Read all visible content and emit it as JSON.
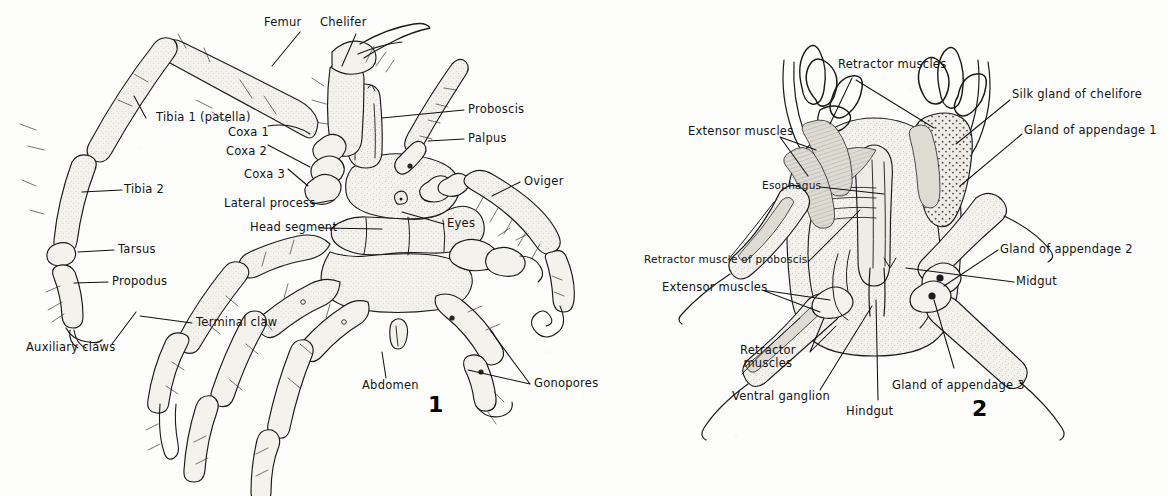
{
  "plate": {
    "background_color": "#fdfdfb",
    "ink_color": "#1a1a1a",
    "figures": [
      {
        "number": "1",
        "caption_number": "1"
      },
      {
        "number": "2",
        "caption_number": "2"
      }
    ]
  },
  "figure1": {
    "number": "1",
    "labels": {
      "femur": "Femur",
      "chelifer": "Chelifer",
      "proboscis": "Proboscis",
      "palpus": "Palpus",
      "tibia_1": "Tibia 1 (patella)",
      "coxa_1": "Coxa 1",
      "coxa_2": "Coxa 2",
      "coxa_3": "Coxa 3",
      "oviger": "Oviger",
      "tibia_2": "Tibia 2",
      "lateral_process": "Lateral process",
      "head_segment": "Head segment",
      "eyes": "Eyes",
      "tarsus": "Tarsus",
      "propodus": "Propodus",
      "terminal_claw": "Terminal claw",
      "auxiliary_claws": "Auxiliary claws",
      "abdomen": "Abdomen",
      "gonopores": "Gonopores"
    }
  },
  "figure2": {
    "number": "2",
    "labels": {
      "retractor_muscles_top": "Retractor muscles",
      "extensor_muscles_top": "Extensor muscles",
      "esophagus": "Esophagus",
      "silk_gland_of_chelifore": "Silk gland of chelifore",
      "gland_of_appendage_1": "Gland of appendage 1",
      "gland_of_appendage_2": "Gland of appendage 2",
      "midgut": "Midgut",
      "retractor_muscle_of_proboscis": "Retractor muscle of proboscis",
      "extensor_muscles_lower": "Extensor muscles",
      "retractor_muscles_lower_line1": "Retractor",
      "retractor_muscles_lower_line2": "muscles",
      "ventral_ganglion": "Ventral ganglion",
      "hindgut": "Hindgut",
      "gland_of_appendage_3": "Gland of appendage 3"
    }
  }
}
